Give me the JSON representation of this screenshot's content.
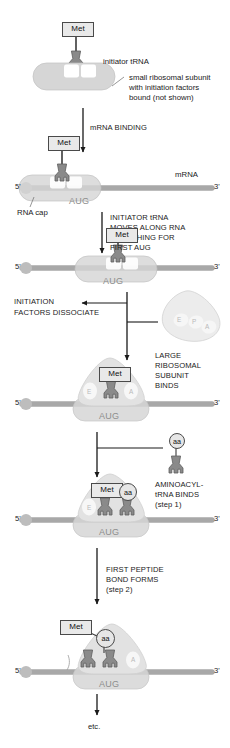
{
  "figure": {
    "background_color": "#ffffff"
  },
  "colors": {
    "met_box_fill": "#e9e9e9",
    "met_box_stroke": "#4a4a4a",
    "trna_fill": "#8a8a8a",
    "trna_stroke": "#5a5a5a",
    "small_subunit_fill": "#d6d6d6",
    "large_subunit_fill": "#dcdcdc",
    "mrna_fill": "#a8a8a8",
    "site_label": "#b9b9b9",
    "aug_label": "#8d8d8d",
    "text": "#1a1a1a"
  },
  "steps": [
    {
      "id": "step-initiator-trna",
      "labels": {
        "met": "Met",
        "initiator_trna": "initiator tRNA",
        "small_subunit_line1": "small ribosomal subunit",
        "small_subunit_line2": "with initiation factors",
        "small_subunit_line3": "bound (not shown)"
      }
    },
    {
      "id": "step-mrna-binding",
      "arrow_label": "mRNA BINDING",
      "labels": {
        "met": "Met",
        "mrna": "mRNA",
        "rna_cap": "RNA cap",
        "five_prime": "5'",
        "three_prime": "3'",
        "codon": "AUG"
      }
    },
    {
      "id": "step-scanning",
      "arrow_label_line1": "INITIATOR tRNA",
      "arrow_label_line2": "MOVES ALONG RNA",
      "arrow_label_line3": "SEARCHING FOR",
      "arrow_label_line4": "FIRST AUG",
      "labels": {
        "met": "Met",
        "five_prime": "5'",
        "three_prime": "3'",
        "codon": "AUG"
      }
    },
    {
      "id": "step-factors-dissociate",
      "side_label_line1": "INITIATION",
      "side_label_line2": "FACTORS DISSOCIATE",
      "large_subunit_sites": [
        "E",
        "P",
        "A"
      ],
      "arrow_label_line1": "LARGE",
      "arrow_label_line2": "RIBOSOMAL",
      "arrow_label_line3": "SUBUNIT",
      "arrow_label_line4": "BINDS"
    },
    {
      "id": "step-large-subunit-bound",
      "labels": {
        "met": "Met",
        "five_prime": "5'",
        "three_prime": "3'",
        "codon": "AUG",
        "site_e": "E",
        "site_a": "A"
      }
    },
    {
      "id": "step-aminoacyl-trna-binds",
      "labels": {
        "aa": "aa",
        "met": "Met",
        "five_prime": "5'",
        "three_prime": "3'",
        "codon": "AUG",
        "site_e": "E"
      },
      "arrow_label_line1": "AMINOACYL-",
      "arrow_label_line2": "tRNA BINDS",
      "arrow_label_line3": "(step 1)"
    },
    {
      "id": "step-first-peptide-bond",
      "arrow_label_line1": "FIRST PEPTIDE",
      "arrow_label_line2": "BOND FORMS",
      "arrow_label_line3": "(step 2)",
      "labels": {
        "met": "Met",
        "aa": "aa",
        "five_prime": "5'",
        "three_prime": "3'",
        "codon": "AUG",
        "site_a": "A"
      }
    },
    {
      "id": "step-etc",
      "label": "etc."
    }
  ]
}
